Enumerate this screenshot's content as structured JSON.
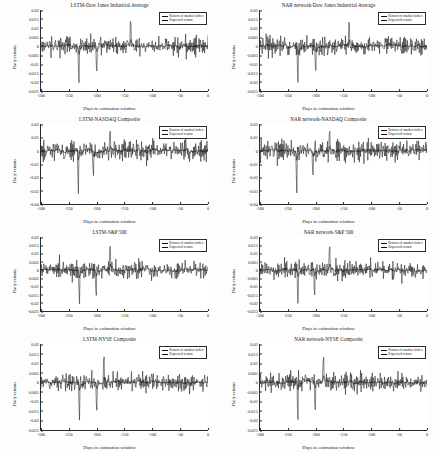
{
  "figure": {
    "layout": "4 rows x 2 columns",
    "axis_labels": {
      "x": "Days in estimation window",
      "y": "Daily returns"
    },
    "legend": {
      "series1": "Return of market index",
      "series2": "Expected return"
    }
  },
  "chart_data": [
    {
      "type": "line",
      "title": "LSTM-Dow Jones Industrial Average",
      "xlabel": "Days in estimation window",
      "ylabel": "Daily returns",
      "xlim": [
        -300,
        0
      ],
      "ylim": [
        -0.025,
        0.02
      ],
      "xticks": [
        "-300",
        "-250",
        "-200",
        "-150",
        "-100",
        "-50",
        "0"
      ],
      "yticks": [
        "0.02",
        "0.015",
        "0.01",
        "0.005",
        "0",
        "-0.005",
        "-0.01",
        "-0.015",
        "-0.02",
        "-0.025"
      ],
      "grid": false,
      "legend_position": "top-right",
      "series": [
        {
          "name": "Return of market index",
          "color": "#111111",
          "style": "solid"
        },
        {
          "name": "Expected return",
          "color": "#111111",
          "style": "solid"
        }
      ],
      "seed": 11,
      "amp": 0.0048,
      "spikes": [
        [
          -232,
          -0.0238
        ],
        [
          -200,
          -0.0176
        ],
        [
          -139,
          0.0192
        ]
      ]
    },
    {
      "type": "line",
      "title": "NAR network-Dow Jones Industrial Average",
      "xlabel": "Days in estimation window",
      "ylabel": "Daily returns",
      "xlim": [
        -300,
        0
      ],
      "ylim": [
        -0.025,
        0.02
      ],
      "xticks": [
        "-300",
        "-250",
        "-200",
        "-150",
        "-100",
        "-50",
        "0"
      ],
      "yticks": [
        "0.02",
        "0.015",
        "0.01",
        "0.005",
        "0",
        "-0.005",
        "-0.01",
        "-0.015",
        "-0.02",
        "-0.025"
      ],
      "grid": false,
      "legend_position": "top-right",
      "series": [
        {
          "name": "Return of market index",
          "color": "#111111",
          "style": "solid"
        },
        {
          "name": "Expected return",
          "color": "#111111",
          "style": "solid"
        }
      ],
      "seed": 27,
      "amp": 0.0048,
      "spikes": [
        [
          -232,
          -0.0236
        ],
        [
          -200,
          -0.0172
        ],
        [
          -140,
          0.0188
        ]
      ]
    },
    {
      "type": "line",
      "title": "LSTM-NASDAQ Composite",
      "xlabel": "Days in estimation window",
      "ylabel": "Daily returns",
      "xlim": [
        -300,
        0
      ],
      "ylim": [
        -0.04,
        0.02
      ],
      "xticks": [
        "-300",
        "-250",
        "-200",
        "-150",
        "-100",
        "-50",
        "0"
      ],
      "yticks": [
        "0.02",
        "0.01",
        "0",
        "-0.01",
        "-0.02",
        "-0.03",
        "-0.04"
      ],
      "grid": false,
      "legend_position": "top-right",
      "series": [
        {
          "name": "Return of market index",
          "color": "#111111",
          "style": "solid"
        },
        {
          "name": "Expected return",
          "color": "#111111",
          "style": "solid"
        }
      ],
      "seed": 43,
      "amp": 0.0072,
      "spikes": [
        [
          -233,
          -0.0374
        ],
        [
          -206,
          -0.0232
        ],
        [
          -176,
          0.0198
        ]
      ]
    },
    {
      "type": "line",
      "title": "NAR network-NASDAQ Composite",
      "xlabel": "Days in estimation window",
      "ylabel": "Daily returns",
      "xlim": [
        -300,
        0
      ],
      "ylim": [
        -0.04,
        0.02
      ],
      "xticks": [
        "-300",
        "-250",
        "-200",
        "-150",
        "-100",
        "-50",
        "0"
      ],
      "yticks": [
        "0.02",
        "0.01",
        "0",
        "-0.01",
        "-0.02",
        "-0.03",
        "-0.04"
      ],
      "grid": false,
      "legend_position": "top-right",
      "series": [
        {
          "name": "Return of market index",
          "color": "#111111",
          "style": "solid"
        },
        {
          "name": "Expected return",
          "color": "#111111",
          "style": "solid"
        }
      ],
      "seed": 59,
      "amp": 0.0072,
      "spikes": [
        [
          -234,
          -0.0368
        ],
        [
          -205,
          -0.0228
        ],
        [
          -175,
          0.0196
        ]
      ]
    },
    {
      "type": "line",
      "title": "LSTM-S&P 500",
      "xlabel": "Days in estimation window",
      "ylabel": "Daily returns",
      "xlim": [
        -300,
        0
      ],
      "ylim": [
        -0.025,
        0.02
      ],
      "xticks": [
        "-300",
        "-250",
        "-200",
        "-150",
        "-100",
        "-50",
        "0"
      ],
      "yticks": [
        "0.02",
        "0.015",
        "0.01",
        "0.005",
        "0",
        "-0.005",
        "-0.01",
        "-0.015",
        "-0.02",
        "-0.025"
      ],
      "grid": false,
      "legend_position": "top-right",
      "series": [
        {
          "name": "Return of market index",
          "color": "#111111",
          "style": "solid"
        },
        {
          "name": "Expected return",
          "color": "#111111",
          "style": "solid"
        }
      ],
      "seed": 73,
      "amp": 0.005,
      "spikes": [
        [
          -231,
          -0.0241
        ],
        [
          -201,
          -0.0196
        ],
        [
          -176,
          0.0194
        ]
      ]
    },
    {
      "type": "line",
      "title": "NAR network-S&P 500",
      "xlabel": "Days in estimation window",
      "ylabel": "Daily returns",
      "xlim": [
        -300,
        0
      ],
      "ylim": [
        -0.025,
        0.02
      ],
      "xticks": [
        "-300",
        "-250",
        "-200",
        "-150",
        "-100",
        "-50",
        "0"
      ],
      "yticks": [
        "0.02",
        "0.015",
        "0.01",
        "0.005",
        "0",
        "-0.005",
        "-0.01",
        "-0.015",
        "-0.02",
        "-0.025"
      ],
      "grid": false,
      "legend_position": "top-right",
      "series": [
        {
          "name": "Return of market index",
          "color": "#111111",
          "style": "solid"
        },
        {
          "name": "Expected return",
          "color": "#111111",
          "style": "solid"
        }
      ],
      "seed": 89,
      "amp": 0.005,
      "spikes": [
        [
          -232,
          -0.0238
        ],
        [
          -202,
          -0.0192
        ],
        [
          -175,
          0.019
        ]
      ]
    },
    {
      "type": "line",
      "title": "LSTM-NYSE Composite",
      "xlabel": "Days in estimation window",
      "ylabel": "Daily returns",
      "xlim": [
        -300,
        0
      ],
      "ylim": [
        -0.025,
        0.02
      ],
      "xticks": [
        "-300",
        "-250",
        "-200",
        "-150",
        "-100",
        "-50",
        "0"
      ],
      "yticks": [
        "0.02",
        "0.015",
        "0.01",
        "0.005",
        "0",
        "-0.005",
        "-0.01",
        "-0.015",
        "-0.02",
        "-0.025"
      ],
      "grid": false,
      "legend_position": "top-right",
      "series": [
        {
          "name": "Return of market index",
          "color": "#111111",
          "style": "solid"
        },
        {
          "name": "Expected return",
          "color": "#111111",
          "style": "solid"
        }
      ],
      "seed": 101,
      "amp": 0.0046,
      "spikes": [
        [
          -231,
          -0.0232
        ],
        [
          -200,
          -0.0186
        ],
        [
          -187,
          0.0174
        ]
      ]
    },
    {
      "type": "line",
      "title": "NAR network-NYSE Composite",
      "xlabel": "Days in estimation window",
      "ylabel": "Daily returns",
      "xlim": [
        -300,
        0
      ],
      "ylim": [
        -0.025,
        0.02
      ],
      "xticks": [
        "-300",
        "-250",
        "-200",
        "-150",
        "-100",
        "-50",
        "0"
      ],
      "yticks": [
        "0.02",
        "0.015",
        "0.01",
        "0.005",
        "0",
        "-0.005",
        "-0.01",
        "-0.015",
        "-0.02",
        "-0.025"
      ],
      "grid": false,
      "legend_position": "top-right",
      "series": [
        {
          "name": "Return of market index",
          "color": "#111111",
          "style": "solid"
        },
        {
          "name": "Expected return",
          "color": "#111111",
          "style": "solid"
        }
      ],
      "seed": 113,
      "amp": 0.0046,
      "spikes": [
        [
          -232,
          -0.0228
        ],
        [
          -201,
          -0.0182
        ],
        [
          -186,
          0.0172
        ]
      ]
    }
  ]
}
